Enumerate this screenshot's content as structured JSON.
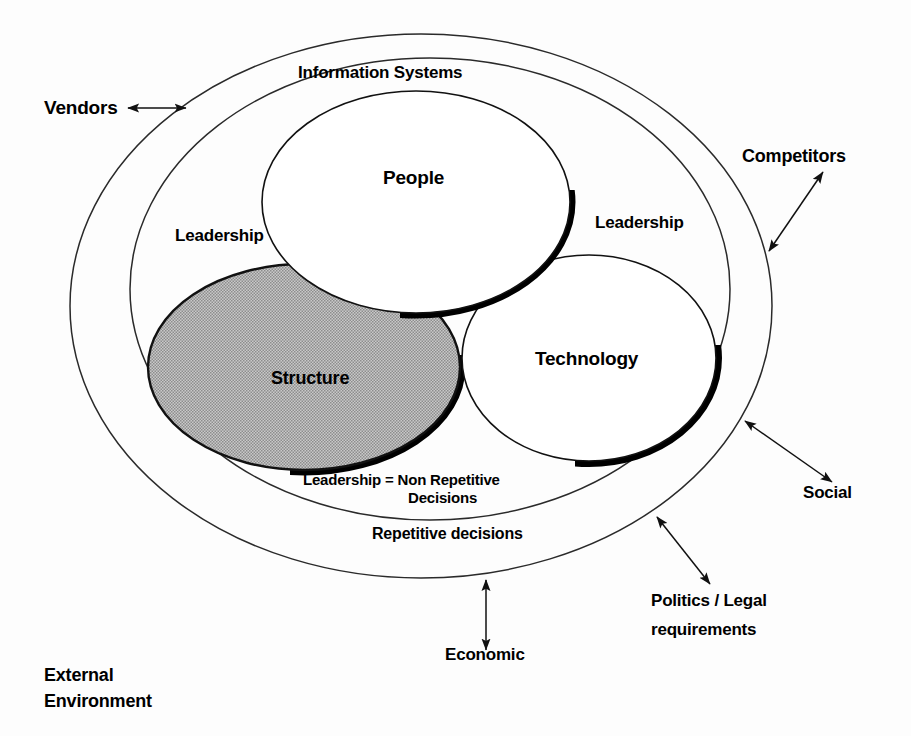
{
  "diagram": {
    "background_color": "#fdfdfd",
    "stroke_color": "#1a1a1a",
    "structure_fill": "#b5b5b5",
    "labels": {
      "information_systems": "Information Systems",
      "vendors": "Vendors",
      "competitors": "Competitors",
      "people": "People",
      "technology": "Technology",
      "structure": "Structure",
      "leadership_left": "Leadership",
      "leadership_right": "Leadership",
      "leadership_equals": "Leadership = ",
      "non_repetitive": "Non Repetitive",
      "decisions": "Decisions",
      "repetitive_decisions": "Repetitive decisions",
      "social": "Social",
      "politics_legal": "Politics / Legal",
      "requirements": "requirements",
      "economic": "Economic",
      "external_line1": "External",
      "external_line2": "Environment"
    },
    "rings": [
      {
        "name": "external-environment-ellipse",
        "cx": 421,
        "cy": 306,
        "rx": 351,
        "ry": 272
      },
      {
        "name": "information-systems-ellipse",
        "cx": 430,
        "cy": 289,
        "rx": 300,
        "ry": 231
      }
    ],
    "circles": [
      {
        "name": "people",
        "cx": 416,
        "cy": 202,
        "rx": 154,
        "ry": 111,
        "fill": "#ffffff"
      },
      {
        "name": "structure",
        "cx": 304,
        "cy": 367,
        "rx": 156,
        "ry": 103,
        "fill": "#b5b5b5"
      },
      {
        "name": "technology",
        "cx": 589,
        "cy": 358,
        "rx": 127,
        "ry": 103,
        "fill": "#ffffff"
      }
    ],
    "arrows": [
      {
        "name": "vendors-arrow",
        "type": "double",
        "x1": 126,
        "y1": 108,
        "x2": 188,
        "y2": 108
      },
      {
        "name": "competitors-arrow",
        "type": "double",
        "x1": 767,
        "y1": 253,
        "x2": 825,
        "y2": 170
      },
      {
        "name": "social-arrow",
        "type": "double",
        "x1": 743,
        "y1": 419,
        "x2": 834,
        "y2": 484
      },
      {
        "name": "politics-arrow",
        "type": "double",
        "x1": 655,
        "y1": 515,
        "x2": 712,
        "y2": 586
      },
      {
        "name": "economic-arrow",
        "type": "double",
        "x1": 486,
        "y1": 578,
        "x2": 486,
        "y2": 652
      }
    ]
  }
}
